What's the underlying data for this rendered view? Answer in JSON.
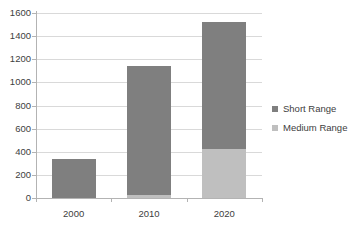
{
  "chart_data": {
    "type": "bar",
    "stacked": true,
    "title": "",
    "subtitle": "",
    "xlabel": "",
    "ylabel": "",
    "categories": [
      "2000",
      "2010",
      "2020"
    ],
    "series": [
      {
        "name": "Medium Range",
        "color": "#bfbfbf",
        "values": [
          0,
          30,
          425
        ]
      },
      {
        "name": "Short Range",
        "color": "#7f7f7f",
        "values": [
          335,
          1110,
          1095
        ]
      }
    ],
    "totals": [
      335,
      1140,
      1520
    ],
    "ylim": [
      0,
      1600
    ],
    "yticks": [
      0,
      200,
      400,
      600,
      800,
      1000,
      1200,
      1400,
      1600
    ],
    "ytick_labels": [
      "0",
      "200",
      "400",
      "600",
      "800",
      "1000",
      "1200",
      "1400",
      "1600"
    ],
    "grid": true,
    "grid_axis": "y",
    "legend_position": "right",
    "legend": [
      {
        "label": "Short Range",
        "color": "#7f7f7f"
      },
      {
        "label": "Medium Range",
        "color": "#bfbfbf"
      }
    ],
    "axis_color": "#b3b3b3",
    "grid_color": "#d9d9d9",
    "text_color": "#404040",
    "background": "#ffffff"
  }
}
